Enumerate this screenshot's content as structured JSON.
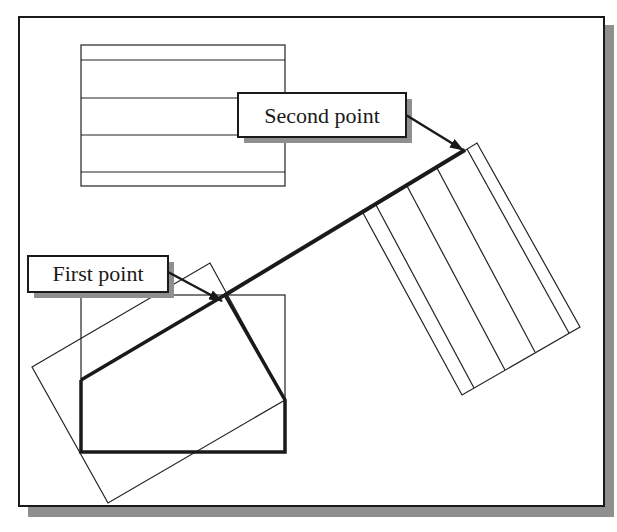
{
  "figure": {
    "background": "#ffffff",
    "frame_color": "#1a1a1a",
    "shadow_color": "#8f8f8f",
    "line_color": "#222222"
  },
  "labels": {
    "second_point": "Second point",
    "first_point": "First point"
  },
  "shapes": {
    "original_rect_top": {
      "x": 81,
      "y": 45,
      "w": 204,
      "h": 141,
      "inner_lines_y": [
        60,
        98,
        135,
        172
      ]
    },
    "original_rect_bottom": {
      "x": 81,
      "y": 295,
      "w": 204,
      "h": 157
    },
    "rotated_rect_left": {
      "points": [
        [
          32,
          367
        ],
        [
          210,
          263
        ],
        [
          285,
          400
        ],
        [
          108,
          503
        ]
      ]
    },
    "rotated_rect_right": {
      "points": [
        [
          363,
          213
        ],
        [
          477,
          143
        ],
        [
          580,
          327
        ],
        [
          462,
          395
        ]
      ]
    },
    "thick_alignment_line": {
      "from": [
        225,
        295
      ],
      "to": [
        465,
        150
      ]
    },
    "thick_outline": {
      "points": [
        [
          81,
          380
        ],
        [
          225,
          295
        ],
        [
          285,
          400
        ],
        [
          285,
          452
        ],
        [
          81,
          452
        ]
      ]
    }
  }
}
